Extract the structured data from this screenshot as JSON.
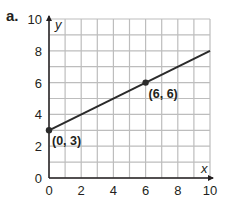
{
  "part_label": "a.",
  "chart_data": {
    "type": "line",
    "title": "",
    "xlabel": "x",
    "ylabel": "y",
    "xlim": [
      0,
      10
    ],
    "ylim": [
      0,
      10
    ],
    "grid": true,
    "grid_step": 1,
    "x_ticks": [
      0,
      2,
      4,
      6,
      8,
      10
    ],
    "y_ticks": [
      0,
      2,
      4,
      6,
      8,
      10
    ],
    "series": [
      {
        "name": "line",
        "x": [
          0,
          10
        ],
        "y": [
          3,
          8
        ],
        "equation": "y = 0.5x + 3"
      }
    ],
    "points": [
      {
        "x": 0,
        "y": 3,
        "label": "(0, 3)"
      },
      {
        "x": 6,
        "y": 6,
        "label": "(6, 6)"
      }
    ],
    "legend": null
  },
  "colors": {
    "grid": "#bdbdbd",
    "axis": "#231f20",
    "line": "#2b2b2b",
    "text": "#231f20"
  }
}
